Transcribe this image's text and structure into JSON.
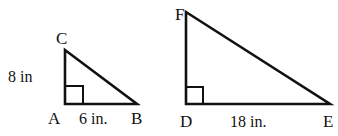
{
  "triangles": [
    {
      "name": "ABC",
      "vertices": {
        "A": {
          "label": "A",
          "x": 65,
          "y": 104
        },
        "B": {
          "label": "B",
          "x": 137,
          "y": 104
        },
        "C": {
          "label": "C",
          "x": 65,
          "y": 50
        }
      },
      "right_angle_at": "A",
      "sides": {
        "AC": {
          "label": "8 in"
        },
        "AB": {
          "label": "6 in."
        }
      }
    },
    {
      "name": "DEF",
      "vertices": {
        "D": {
          "label": "D",
          "x": 186,
          "y": 104
        },
        "E": {
          "label": "E",
          "x": 330,
          "y": 104
        },
        "F": {
          "label": "F",
          "x": 186,
          "y": 12
        }
      },
      "right_angle_at": "D",
      "sides": {
        "DE": {
          "label": "18 in."
        }
      }
    }
  ],
  "colors": {
    "stroke": "#111111",
    "background": "#ffffff"
  }
}
